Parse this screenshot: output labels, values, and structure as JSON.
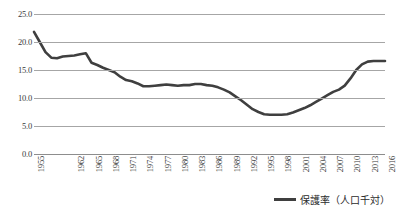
{
  "chart_data": {
    "type": "line",
    "title": "",
    "xlabel": "",
    "ylabel": "",
    "ylim": [
      0.0,
      25.0
    ],
    "ytick_step": 5.0,
    "ytick_labels": [
      "25.0",
      "20.0",
      "15.0",
      "10.0",
      "5.0",
      "0.0"
    ],
    "ytick_values": [
      25.0,
      20.0,
      15.0,
      10.0,
      5.0,
      0.0
    ],
    "grid": "horizontal",
    "legend_position": "bottom-right",
    "series": [
      {
        "name": "保護率（人口千対）",
        "color": "#3f3f3f",
        "x": [
          1955,
          1956,
          1957,
          1958,
          1959,
          1960,
          1961,
          1962,
          1963,
          1964,
          1965,
          1966,
          1967,
          1968,
          1969,
          1970,
          1971,
          1972,
          1973,
          1974,
          1975,
          1976,
          1977,
          1978,
          1979,
          1980,
          1981,
          1982,
          1983,
          1984,
          1985,
          1986,
          1987,
          1988,
          1989,
          1990,
          1991,
          1992,
          1993,
          1994,
          1995,
          1996,
          1997,
          1998,
          1999,
          2000,
          2001,
          2002,
          2003,
          2004,
          2005,
          2006,
          2007,
          2008,
          2009,
          2010,
          2011,
          2012,
          2013,
          2014,
          2015,
          2016
        ],
        "values": [
          21.8,
          20.0,
          18.2,
          17.2,
          17.1,
          17.4,
          17.5,
          17.6,
          17.8,
          18.0,
          16.3,
          15.9,
          15.4,
          15.0,
          14.6,
          13.8,
          13.2,
          13.0,
          12.6,
          12.1,
          12.1,
          12.2,
          12.3,
          12.4,
          12.3,
          12.2,
          12.3,
          12.3,
          12.5,
          12.5,
          12.3,
          12.2,
          11.9,
          11.5,
          11.0,
          10.3,
          9.6,
          8.8,
          8.0,
          7.5,
          7.1,
          7.0,
          7.0,
          7.0,
          7.1,
          7.4,
          7.8,
          8.2,
          8.7,
          9.3,
          9.9,
          10.5,
          11.1,
          11.5,
          12.2,
          13.5,
          15.0,
          16.0,
          16.5,
          16.6,
          16.6,
          16.6
        ]
      }
    ],
    "xtick_labels": [
      "1955",
      "1962",
      "1965",
      "1968",
      "1971",
      "1974",
      "1977",
      "1980",
      "1983",
      "1986",
      "1989",
      "1992",
      "1995",
      "1998",
      "2001",
      "2004",
      "2007",
      "2010",
      "2013",
      "2016"
    ],
    "xtick_values": [
      1955,
      1962,
      1965,
      1968,
      1971,
      1974,
      1977,
      1980,
      1983,
      1986,
      1989,
      1992,
      1995,
      1998,
      2001,
      2004,
      2007,
      2010,
      2013,
      2016
    ],
    "xlim": [
      1955,
      2016
    ]
  },
  "legend": {
    "label": "保護率（人口千対）",
    "swatch_color": "#3f3f3f"
  }
}
